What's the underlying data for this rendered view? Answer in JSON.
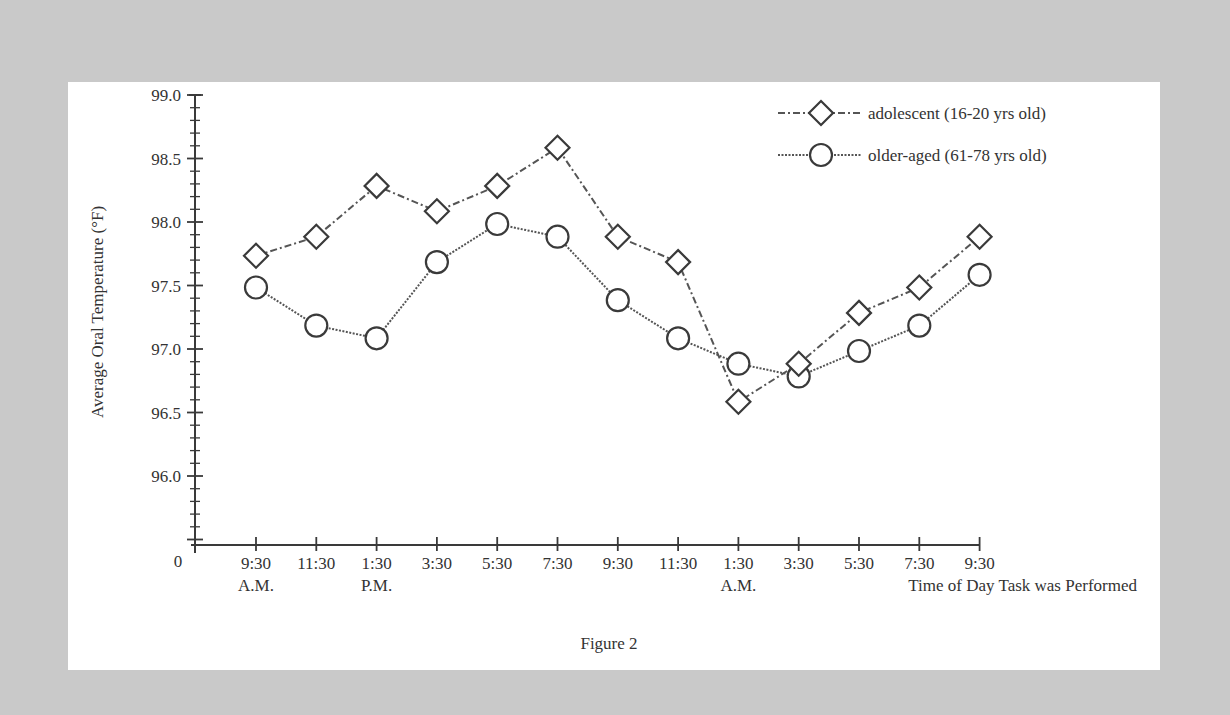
{
  "figure": {
    "caption": "Figure 2"
  },
  "legend": [
    {
      "marker": "diamond",
      "label": "adolescent (16-20 yrs old)",
      "line_style": "dash-dot"
    },
    {
      "marker": "circle",
      "label": "older-aged (61-78 yrs old)",
      "line_style": "dotted"
    }
  ],
  "axes": {
    "y_title": "Average Oral Temperature (°F)",
    "x_title": "Time of Day Task was Performed",
    "origin_label": "0",
    "y_ticks": [
      "99.0",
      "98.5",
      "98.0",
      "97.5",
      "97.0",
      "96.5",
      "96.0"
    ],
    "x_ticks": [
      "9:30",
      "11:30",
      "1:30",
      "3:30",
      "5:30",
      "7:30",
      "9:30",
      "11:30",
      "1:30",
      "3:30",
      "5:30",
      "7:30",
      "9:30"
    ],
    "x_sublabels": [
      {
        "index": 0,
        "text": "A.M."
      },
      {
        "index": 2,
        "text": "P.M."
      },
      {
        "index": 8,
        "text": "A.M."
      }
    ]
  },
  "chart_data": {
    "type": "line",
    "title": "Figure 2",
    "xlabel": "Time of Day Task was Performed",
    "ylabel": "Average Oral Temperature (°F)",
    "categories": [
      "9:30 A.M.",
      "11:30",
      "1:30 P.M.",
      "3:30",
      "5:30",
      "7:30",
      "9:30",
      "11:30",
      "1:30 A.M.",
      "3:30",
      "5:30",
      "7:30",
      "9:30"
    ],
    "series": [
      {
        "name": "adolescent (16-20 yrs old)",
        "marker": "diamond",
        "values": [
          97.75,
          97.9,
          98.3,
          98.1,
          98.3,
          98.6,
          97.9,
          97.7,
          96.6,
          96.9,
          97.3,
          97.5,
          97.9
        ]
      },
      {
        "name": "older-aged (61-78 yrs old)",
        "marker": "circle",
        "values": [
          97.5,
          97.2,
          97.1,
          97.7,
          98.0,
          97.9,
          97.4,
          97.1,
          96.9,
          96.8,
          97.0,
          97.2,
          97.6
        ]
      }
    ],
    "ylim": [
      95.5,
      99.0
    ],
    "y_axis_break": true,
    "grid": false,
    "legend_position": "top-right"
  }
}
